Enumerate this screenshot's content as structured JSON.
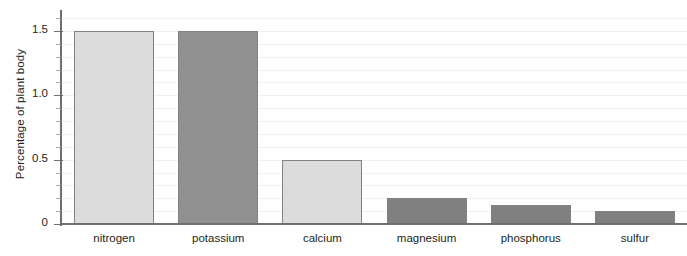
{
  "chart_data": {
    "type": "bar",
    "title": "",
    "xlabel": "",
    "ylabel": "Percentage of plant body",
    "categories": [
      "nitrogen",
      "potassium",
      "calcium",
      "magnesium",
      "phosphorus",
      "sulfur"
    ],
    "values": [
      1.5,
      1.5,
      0.5,
      0.2,
      0.15,
      0.1
    ],
    "bar_colors": [
      "#dcdcdc",
      "#909090",
      "#dcdcdc",
      "#808080",
      "#808080",
      "#808080"
    ],
    "bar_border_color": "#808285",
    "ylim": [
      0,
      1.6
    ],
    "ytick_values": [
      0,
      0.5,
      1.0,
      1.5
    ],
    "ytick_labels": [
      "0",
      "0.5",
      "1.0",
      "1.5"
    ],
    "yminor_step": 0.1,
    "grid": true,
    "gridline_color": "#f1f1f3",
    "axis_color": "#6d6e71",
    "text_color": "#231f20",
    "legend": "none"
  }
}
